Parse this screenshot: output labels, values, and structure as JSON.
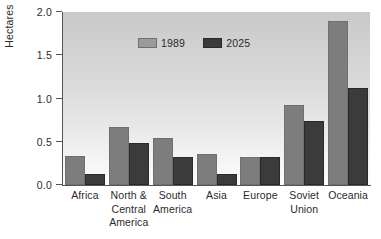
{
  "chart_data": {
    "type": "bar",
    "title": "",
    "subtitle": "",
    "xlabel": "",
    "ylabel": "Hectares",
    "ylim": [
      0.0,
      2.0
    ],
    "ytick_labels": [
      "0.0",
      "0.5",
      "1.0",
      "1.5",
      "2.0"
    ],
    "ytick_values": [
      0.0,
      0.5,
      1.0,
      1.5,
      2.0
    ],
    "grid": false,
    "legend_position": "inside-top-center",
    "categories": [
      "Africa",
      "North & Central America",
      "South America",
      "Asia",
      "Europe",
      "Soviet Union",
      "Oceania"
    ],
    "category_label_lines": [
      [
        "Africa"
      ],
      [
        "North &",
        "Central",
        "America"
      ],
      [
        "South",
        "America"
      ],
      [
        "Asia"
      ],
      [
        "Europe"
      ],
      [
        "Soviet",
        "Union"
      ],
      [
        "Oceania"
      ]
    ],
    "series": [
      {
        "name": "1989",
        "color": "#7d7d7d",
        "values": [
          0.34,
          0.67,
          0.54,
          0.36,
          0.32,
          0.93,
          1.9
        ]
      },
      {
        "name": "2025",
        "color": "#3b3b3b",
        "values": [
          0.13,
          0.49,
          0.32,
          0.13,
          0.32,
          0.74,
          1.12
        ]
      }
    ]
  },
  "colors": {
    "series_1989": "#7d7d7d",
    "series_2025": "#3b3b3b",
    "axis": "#555555",
    "text": "#2b2b2b",
    "plot_background_top": "#c9c9c9",
    "plot_background_bottom": "#fcfcfc"
  }
}
